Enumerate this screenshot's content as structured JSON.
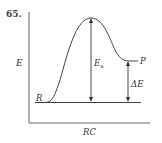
{
  "problem_number": "65.",
  "diagram": {
    "type": "energy-profile",
    "y_axis_label": "E",
    "x_axis_label": "RC",
    "reactant_label": "R",
    "product_label": "P",
    "activation_energy_label": "Ea",
    "activation_energy_main": "E",
    "activation_energy_sub": "a",
    "delta_e_label": "ΔE",
    "colors": {
      "line": "#333333",
      "axis": "#666666"
    }
  }
}
